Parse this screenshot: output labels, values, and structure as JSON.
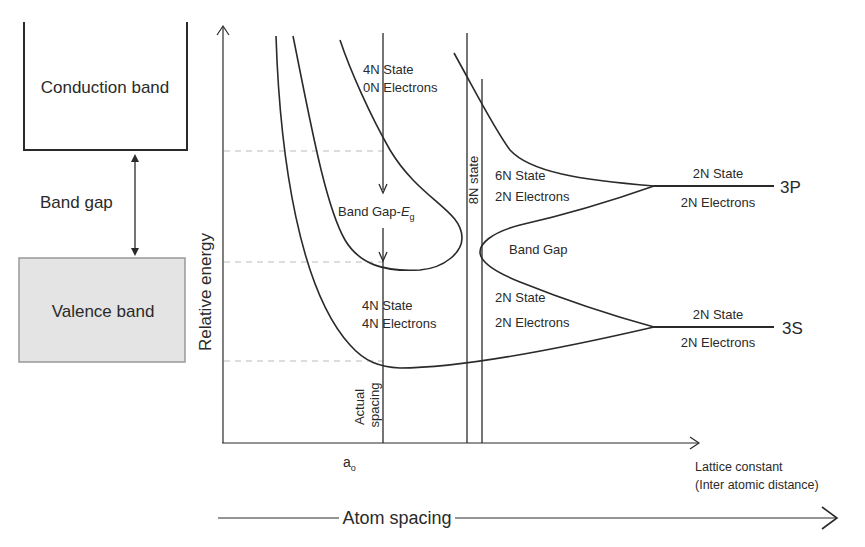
{
  "left_panel": {
    "conduction_band_label": "Conduction band",
    "band_gap_label": "Band gap",
    "valence_band_label": "Valence band"
  },
  "axes": {
    "y_label": "Relative energy",
    "x_label_line1": "Lattice constant",
    "x_label_line2": "(Inter atomic distance)",
    "x_tick": "a",
    "x_tick_subscript": "o",
    "atom_spacing_label": "Atom spacing"
  },
  "annotations": {
    "upper_band_state": "4N State",
    "upper_band_electrons": "0N Electrons",
    "band_gap_eg": "Band Gap-",
    "band_gap_eg_symbol": "E",
    "band_gap_eg_subscript": "g",
    "lower_band_state": "4N State",
    "lower_band_electrons": "4N Electrons",
    "actual_spacing_line1": "Actual",
    "actual_spacing_line2": "spacing",
    "eight_n_state": "8N state",
    "p_split_state": "6N State",
    "p_split_electrons": "2N Electrons",
    "middle_band_gap": "Band Gap",
    "s_split_state": "2N State",
    "s_split_electrons": "2N Electrons",
    "level_3p_state": "2N State",
    "level_3p_electrons": "2N Electrons",
    "level_3p": "3P",
    "level_3s_state": "2N State",
    "level_3s_electrons": "2N Electrons",
    "level_3s": "3S"
  },
  "colors": {
    "line": "#2a2a2a",
    "dashed": "#bbbbbb",
    "valence_fill": "#e4e4e4",
    "valence_border": "#999999"
  }
}
